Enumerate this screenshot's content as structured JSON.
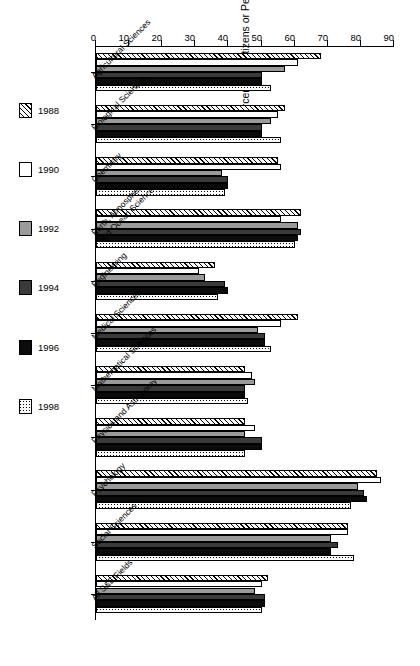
{
  "chart_data": {
    "type": "bar",
    "title": "",
    "subtitle": "",
    "xlabel": "",
    "ylabel": "Percent US Citizens or Permanent Residents",
    "ylim": [
      0,
      90
    ],
    "yticks": [
      0,
      10,
      20,
      30,
      40,
      50,
      60,
      70,
      80,
      90
    ],
    "grid": false,
    "orientation": "horizontal",
    "legend_position": "bottom-left",
    "categories": [
      "Agricultural Sciences",
      "Biological Sciences",
      "Chemistry",
      "Earth, Atmospheric,\nand Ocean Sciences",
      "Engineering",
      "Medical Sciences",
      "Mathematical Sciences",
      "Physics and Astronomy",
      "Psychology",
      "Social Sciences",
      "All S&E Fields"
    ],
    "series": [
      {
        "name": "1988",
        "pattern": "diagonal-hatch",
        "color": "#ffffff",
        "values": [
          68,
          57,
          55,
          62,
          36,
          61,
          45,
          45,
          85,
          76,
          52
        ]
      },
      {
        "name": "1990",
        "pattern": "solid-white",
        "color": "#ffffff",
        "values": [
          61,
          55,
          56,
          56,
          31,
          56,
          47,
          48,
          86,
          76,
          50
        ]
      },
      {
        "name": "1992",
        "pattern": "solid-gray",
        "color": "#9a9a9a",
        "values": [
          57,
          53,
          38,
          61,
          33,
          49,
          48,
          45,
          79,
          71,
          48
        ]
      },
      {
        "name": "1994",
        "pattern": "solid-dark-gray",
        "color": "#3a3a3a",
        "values": [
          50,
          50,
          40,
          62,
          39,
          51,
          45,
          50,
          81,
          73,
          51
        ]
      },
      {
        "name": "1996",
        "pattern": "solid-black",
        "color": "#0b0b0b",
        "values": [
          50,
          50,
          40,
          61,
          40,
          51,
          45,
          50,
          82,
          71,
          51
        ]
      },
      {
        "name": "1998",
        "pattern": "dotted",
        "color": "#ffffff",
        "values": [
          53,
          56,
          39,
          60,
          37,
          53,
          46,
          45,
          77,
          78,
          50
        ]
      }
    ]
  },
  "legend": {
    "items": [
      {
        "label": "1988"
      },
      {
        "label": "1990"
      },
      {
        "label": "1992"
      },
      {
        "label": "1994"
      },
      {
        "label": "1996"
      },
      {
        "label": "1998"
      }
    ]
  }
}
